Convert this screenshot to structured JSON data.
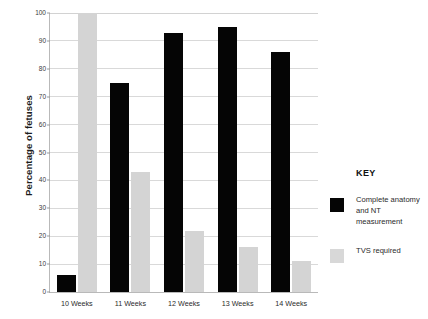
{
  "chart_data": {
    "type": "bar",
    "title": "",
    "xlabel": "",
    "ylabel": "Percentage of fetuses",
    "ylim": [
      0,
      100
    ],
    "yticks": [
      0,
      10,
      20,
      30,
      40,
      50,
      60,
      70,
      80,
      90,
      100
    ],
    "grid": true,
    "legend_position": "right",
    "categories": [
      "10 Weeks",
      "11 Weeks",
      "12 Weeks",
      "13 Weeks",
      "14 Weeks"
    ],
    "series": [
      {
        "name": "Complete anatomy and NT measurement",
        "color": "#050505",
        "values": [
          6,
          75,
          93,
          95,
          86
        ]
      },
      {
        "name": "TVS required",
        "color": "#d4d4d4",
        "values": [
          100,
          43,
          22,
          16,
          11
        ]
      }
    ]
  },
  "axes": {
    "y_title": "Percentage of fetuses",
    "y_tick_labels": [
      "100",
      "90",
      "80",
      "70",
      "60",
      "50",
      "40",
      "30",
      "20",
      "10",
      "0"
    ],
    "x_tick_labels": [
      "10 Weeks",
      "11 Weeks",
      "12 Weeks",
      "13 Weeks",
      "14 Weeks"
    ]
  },
  "legend": {
    "title": "KEY",
    "entries": [
      {
        "label": "Complete anatomy and NT measurement",
        "color": "#050505"
      },
      {
        "label": "TVS required",
        "color": "#d8d8d8"
      }
    ]
  }
}
